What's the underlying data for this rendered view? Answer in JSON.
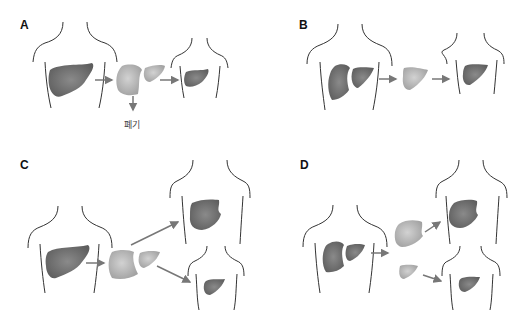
{
  "figure": {
    "panels": [
      {
        "id": "A",
        "label": "A",
        "description": "Whole liver from donor split; one part discarded, remainder transplanted into recipient",
        "discard_label": "폐기"
      },
      {
        "id": "B",
        "label": "B",
        "description": "Living donor partial liver graft transplanted into recipient"
      },
      {
        "id": "C",
        "label": "C",
        "description": "Whole liver split into two grafts for an adult recipient and a child recipient"
      },
      {
        "id": "D",
        "label": "D",
        "description": "Living donor left and right lobes given to two recipients"
      }
    ]
  },
  "colors": {
    "liver_dark": "#6e6e6e",
    "liver_light": "#b4b4b4",
    "arrow": "#777777",
    "outline": "#333333"
  }
}
